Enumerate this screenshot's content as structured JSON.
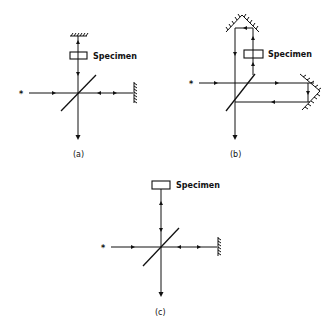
{
  "figure": {
    "panels": [
      {
        "id": "a",
        "caption": "(a)",
        "specimen_label": "Specimen",
        "description": "Michelson-type interferometer with specimen in one arm, plane mirrors"
      },
      {
        "id": "b",
        "caption": "(b)",
        "specimen_label": "Specimen",
        "description": "Interferometer with roof (corner) mirrors, specimen traversed once"
      },
      {
        "id": "c",
        "caption": "(c)",
        "specimen_label": "Specimen",
        "description": "Interferometer with reflecting specimen replacing top mirror"
      }
    ],
    "symbols": {
      "source": "star-source-icon",
      "beamsplitter": "diagonal-beamsplitter",
      "mirror": "hatched-mirror-icon",
      "roof_mirror": "roof-mirror-icon"
    },
    "colors": {
      "ink": "#111111",
      "background": "#ffffff"
    }
  }
}
